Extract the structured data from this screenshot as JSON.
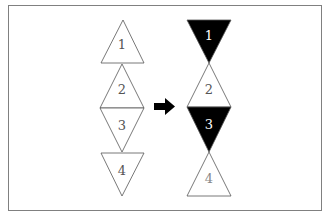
{
  "diagram": {
    "frame": {
      "x": 8,
      "y": 5,
      "w": 314,
      "h": 206,
      "stroke": "#808080"
    },
    "left_column": [
      {
        "label": "1",
        "dir": "up",
        "fill": "#ffffff",
        "text_color": "#555555",
        "points": "123,20 101,63 144,63",
        "tx": 122,
        "ty": 49
      },
      {
        "label": "2",
        "dir": "up",
        "fill": "#ffffff",
        "text_color": "#555555",
        "points": "122,64 100,108 144,108",
        "tx": 122,
        "ty": 94
      },
      {
        "label": "3",
        "dir": "down",
        "fill": "#ffffff",
        "text_color": "#555555",
        "points": "100,108 144,108 122,152",
        "tx": 122,
        "ty": 130
      },
      {
        "label": "4",
        "dir": "down",
        "fill": "#ffffff",
        "text_color": "#555555",
        "points": "101,153 144,153 122,196",
        "tx": 122,
        "ty": 175
      }
    ],
    "right_column": [
      {
        "label": "1",
        "dir": "down",
        "fill": "#000000",
        "text_color": "#ffffff",
        "points": "187,20 231,20 209,63",
        "tx": 209,
        "ty": 40
      },
      {
        "label": "2",
        "dir": "up",
        "fill": "#ffffff",
        "text_color": "#555555",
        "points": "209,63 187,107 231,107",
        "tx": 209,
        "ty": 94
      },
      {
        "label": "3",
        "dir": "down",
        "fill": "#000000",
        "text_color": "#ffffff",
        "points": "187,107 231,107 209,152",
        "tx": 209,
        "ty": 129
      },
      {
        "label": "4",
        "dir": "up",
        "fill": "#ffffff",
        "text_color": "#888888",
        "points": "209,152 187,196 231,196",
        "tx": 209,
        "ty": 183
      }
    ],
    "arrow": {
      "direction": "right",
      "color": "#000000"
    }
  }
}
